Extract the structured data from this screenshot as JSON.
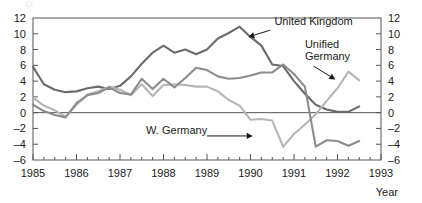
{
  "chart_data": {
    "type": "line",
    "title": "",
    "subtitle": "",
    "xlabel": "Year",
    "ylabel": "",
    "xlim": [
      1985.0,
      1993.0
    ],
    "ylim": [
      -6,
      12
    ],
    "x_ticks": [
      1985,
      1986,
      1987,
      1988,
      1989,
      1990,
      1991,
      1992,
      1993
    ],
    "x_tick_labels": [
      "1985",
      "1986",
      "1987",
      "1988",
      "1989",
      "1990",
      "1991",
      "1992",
      "1993"
    ],
    "x_minor_interval": 0.25,
    "y_ticks": [
      -6,
      -4,
      -2,
      0,
      2,
      4,
      6,
      8,
      10,
      12
    ],
    "y_tick_labels_left": [
      "-6",
      "-4",
      "-2",
      "0",
      "2",
      "4",
      "6",
      "8",
      "10",
      "12"
    ],
    "y_tick_labels_right": [
      "-6",
      "-4",
      "-2",
      "0",
      "2",
      "4",
      "6",
      "8",
      "10",
      "12"
    ],
    "grid": false,
    "legend_position": "inline-annotations",
    "zero_line": 0,
    "series": [
      {
        "name": "United Kingdom",
        "color": "#6b6b6b",
        "x": [
          1985.0,
          1985.25,
          1985.5,
          1985.75,
          1986.0,
          1986.25,
          1986.5,
          1986.75,
          1987.0,
          1987.25,
          1987.5,
          1987.75,
          1988.0,
          1988.25,
          1988.5,
          1988.75,
          1989.0,
          1989.25,
          1989.5,
          1989.75,
          1990.0,
          1990.25,
          1990.5,
          1990.75,
          1991.0,
          1991.25,
          1991.5,
          1991.75,
          1992.0,
          1992.25,
          1992.5
        ],
        "values": [
          5.8,
          3.6,
          2.9,
          2.6,
          2.7,
          3.1,
          3.3,
          3.0,
          3.4,
          4.6,
          6.2,
          7.6,
          8.5,
          7.6,
          8.0,
          7.4,
          8.0,
          9.4,
          10.1,
          10.9,
          9.6,
          8.5,
          6.1,
          5.9,
          4.0,
          2.4,
          1.0,
          0.4,
          0.1,
          0.1,
          0.8
        ]
      },
      {
        "name": "W. Germany",
        "color": "#b5b5b5",
        "x": [
          1985.0,
          1985.25,
          1985.5,
          1985.75,
          1986.0,
          1986.25,
          1986.5,
          1986.75,
          1987.0,
          1987.25,
          1987.5,
          1987.75,
          1988.0,
          1988.25,
          1988.5,
          1988.75,
          1989.0,
          1989.25,
          1989.5,
          1989.75,
          1990.0,
          1990.25,
          1990.5,
          1990.75
        ],
        "values": [
          1.9,
          0.9,
          0.3,
          -0.5,
          1.0,
          2.3,
          2.7,
          3.3,
          2.9,
          2.2,
          3.6,
          2.1,
          3.5,
          3.6,
          3.5,
          3.3,
          3.3,
          2.7,
          1.6,
          0.9,
          -0.9,
          -0.8,
          -1.0,
          -4.3
        ]
      },
      {
        "name": "Unified Germany",
        "color": "#b5b5b5",
        "x": [
          1990.75,
          1991.0,
          1991.25,
          1991.5,
          1991.75,
          1992.0,
          1992.25,
          1992.5
        ],
        "values": [
          -4.3,
          -2.7,
          -1.5,
          -0.2,
          1.5,
          3.1,
          5.2,
          4.1
        ]
      },
      {
        "name": "Third series",
        "color": "#8c8c8c",
        "x": [
          1985.0,
          1985.25,
          1985.5,
          1985.75,
          1986.0,
          1986.25,
          1986.5,
          1986.75,
          1987.0,
          1987.25,
          1987.5,
          1987.75,
          1988.0,
          1988.25,
          1988.5,
          1988.75,
          1989.0,
          1989.25,
          1989.5,
          1989.75,
          1990.0,
          1990.25,
          1990.5,
          1990.75,
          1991.0,
          1991.25,
          1991.5,
          1991.75,
          1992.0,
          1992.25,
          1992.5
        ],
        "values": [
          1.0,
          0.2,
          -0.3,
          -0.6,
          1.2,
          2.2,
          2.5,
          3.2,
          2.5,
          2.3,
          4.3,
          3.0,
          4.3,
          3.2,
          4.4,
          5.7,
          5.4,
          4.6,
          4.3,
          4.4,
          4.7,
          5.1,
          5.1,
          6.1,
          4.9,
          3.3,
          -4.3,
          -3.5,
          -3.6,
          -4.2,
          -3.6
        ]
      }
    ],
    "annotations": [
      {
        "label": "United Kingdom",
        "text_x": 1990.55,
        "text_y": 11.1,
        "arrow_from_x": 1990.45,
        "arrow_from_y": 10.45,
        "arrow_to_x": 1989.95,
        "arrow_to_y": 9.6
      },
      {
        "label_line1": "Unified",
        "label_line2": "Germany",
        "text_x": 1991.25,
        "text_y": 8.2,
        "arrow_from_x": 1991.45,
        "arrow_from_y": 5.9,
        "arrow_to_x": 1991.95,
        "arrow_to_y": 4.2
      },
      {
        "label": "W. Germany",
        "text_x": 1987.6,
        "text_y": -2.75,
        "arrow_from_x": 1989.0,
        "arrow_from_y": -2.95,
        "arrow_to_x": 1990.05,
        "arrow_to_y": -2.95
      }
    ]
  },
  "axis": {
    "x_title": "Year"
  },
  "colors": {
    "united_kingdom": "#6b6b6b",
    "unified_germany": "#b5b5b5",
    "w_germany": "#b5b5b5",
    "third_series": "#8c8c8c",
    "frame": "#555555",
    "text": "#1a1a1a",
    "background": "#ffffff"
  }
}
